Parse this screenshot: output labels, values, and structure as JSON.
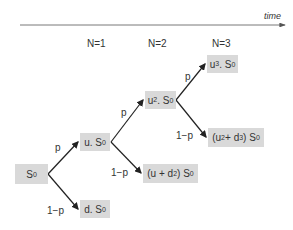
{
  "axis": {
    "label": "time"
  },
  "steps": [
    {
      "label": "N=1"
    },
    {
      "label": "N=2"
    },
    {
      "label": "N=3"
    }
  ],
  "nodes": {
    "root": {
      "html": "S<sub>0</sub>"
    },
    "u": {
      "html": "u. S<sub>0</sub>"
    },
    "d": {
      "html": "d. S<sub>0</sub>"
    },
    "uu": {
      "html": "u<sup>2</sup>. S<sub>0</sub>"
    },
    "ud": {
      "html": "(u + d<sup>2</sup>) S<sub>0</sub>"
    },
    "uuu": {
      "html": "u<sup>3</sup>. S<sub>0</sub>"
    },
    "uud": {
      "html": "(u<sup>2</sup> + d<sup>3</sup>) S<sub>0</sub>"
    }
  },
  "edge_labels": {
    "root_up": "p",
    "root_down": "1−p",
    "u_up": "p",
    "u_down": "1−p",
    "uu_up": "p",
    "uu_down": "1−p"
  },
  "colors": {
    "box": "#d9d9d9",
    "line": "#222222"
  }
}
